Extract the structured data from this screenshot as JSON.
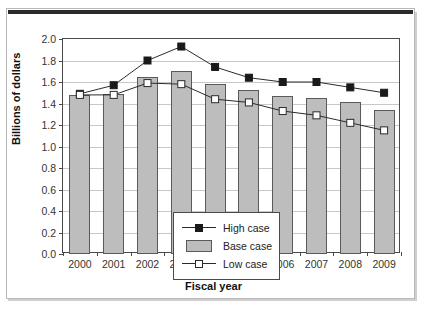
{
  "chart_data": {
    "type": "bar",
    "title": "",
    "xlabel": "Fiscal year",
    "ylabel": "Billions of dollars",
    "categories": [
      "2000",
      "2001",
      "2002",
      "2003",
      "2004",
      "2005",
      "2006",
      "2007",
      "2008",
      "2009"
    ],
    "ylim": [
      0.0,
      2.0
    ],
    "ytick_labels": [
      "0.0",
      "0.2",
      "0.4",
      "0.6",
      "0.8",
      "1.0",
      "1.2",
      "1.4",
      "1.6",
      "1.8",
      "2.0"
    ],
    "ytick_values": [
      0.0,
      0.2,
      0.4,
      0.6,
      0.8,
      1.0,
      1.2,
      1.4,
      1.6,
      1.8,
      2.0
    ],
    "grid": true,
    "legend_position": "inside-lower-left",
    "series": [
      {
        "name": "High case",
        "type": "line",
        "marker": "filled-square",
        "color": "#1a1a1a",
        "values": [
          1.49,
          1.57,
          1.8,
          1.93,
          1.74,
          1.64,
          1.6,
          1.6,
          1.55,
          1.5
        ]
      },
      {
        "name": "Base case",
        "type": "bar",
        "marker": "gray-bar",
        "color": "#bdbdbd",
        "values": [
          1.48,
          1.49,
          1.65,
          1.7,
          1.58,
          1.53,
          1.47,
          1.45,
          1.41,
          1.34
        ]
      },
      {
        "name": "Low case",
        "type": "line",
        "marker": "open-square",
        "color": "#ffffff",
        "values": [
          1.48,
          1.48,
          1.59,
          1.58,
          1.44,
          1.41,
          1.33,
          1.29,
          1.22,
          1.15
        ]
      }
    ]
  },
  "legend": {
    "items": [
      {
        "label": "High case",
        "key": "filled-square-line"
      },
      {
        "label": "Base case",
        "key": "gray-bar"
      },
      {
        "label": "Low case",
        "key": "open-square-line"
      }
    ]
  },
  "colors": {
    "bar_fill": "#bdbdbd",
    "bar_stroke": "#5a5a5a",
    "line": "#2b2b2b",
    "grid": "#c8c8c8",
    "axis": "#4a4a4a",
    "frame": "#b9b9b9",
    "top_bar": "#2b2b2b"
  }
}
